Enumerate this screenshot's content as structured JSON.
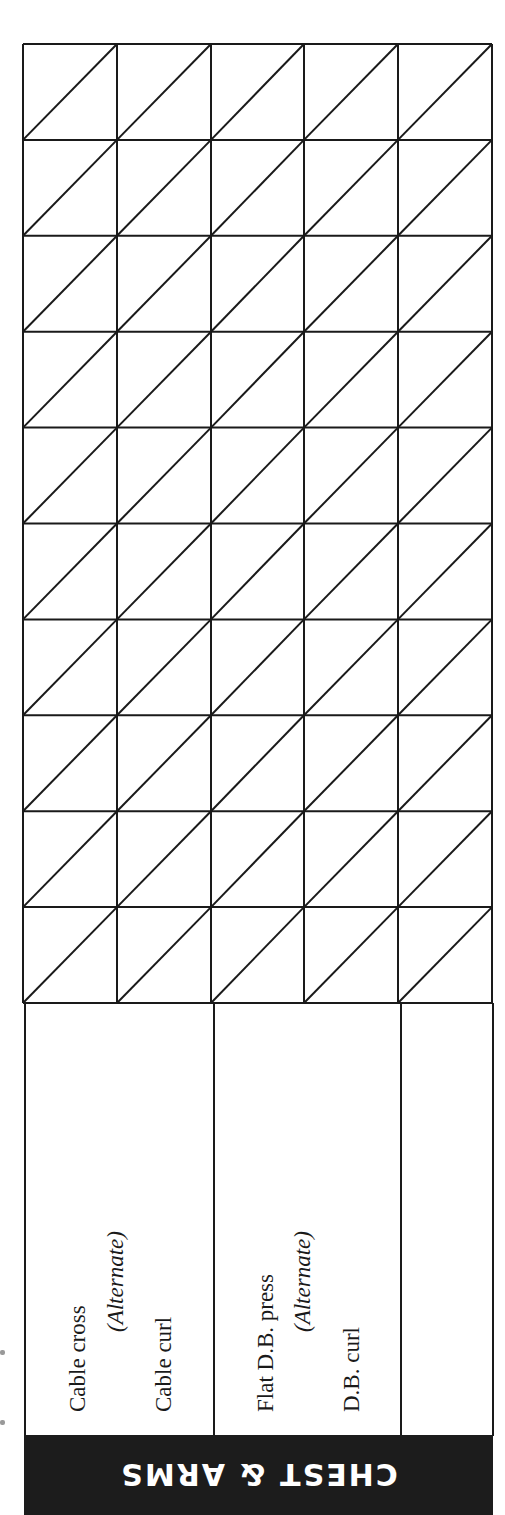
{
  "section": {
    "title": "CHEST & ARMS",
    "header_bg": "#1c1c1c",
    "header_fg": "#ffffff"
  },
  "log_grid": {
    "columns": 5,
    "rows": 10,
    "cell_style": "diagonal-split",
    "line_color": "#1a1a1a"
  },
  "exercises": [
    {
      "primary": "Cable cross",
      "connector": "(Alternate)",
      "secondary": "Cable curl"
    },
    {
      "primary": "Flat D.B. press",
      "connector": "(Alternate)",
      "secondary": "D.B. curl"
    },
    {
      "primary": "",
      "connector": "",
      "secondary": ""
    }
  ]
}
